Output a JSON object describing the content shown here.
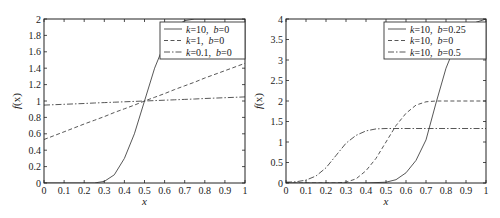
{
  "chart_data": [
    {
      "type": "line",
      "title": "",
      "xlabel": "x",
      "ylabel": "f(x)",
      "xlim": [
        0,
        1
      ],
      "ylim": [
        0,
        2
      ],
      "xticks": [
        "0",
        "0.1",
        "0.2",
        "0.3",
        "0.4",
        "0.5",
        "0.6",
        "0.7",
        "0.8",
        "0.9",
        "1"
      ],
      "yticks": [
        "0",
        "0.2",
        "0.4",
        "0.6",
        "0.8",
        "1",
        "1.2",
        "1.4",
        "1.6",
        "1.8",
        "2"
      ],
      "grid": false,
      "legend_position": "upper right",
      "x": [
        0,
        0.1,
        0.2,
        0.25,
        0.3,
        0.35,
        0.4,
        0.45,
        0.5,
        0.55,
        0.6,
        0.65,
        0.7,
        0.75,
        0.8,
        0.9,
        1.0
      ],
      "series": [
        {
          "name": "k=10, b=0",
          "k_label": "k",
          "k_value": "=10",
          "b_label": "b",
          "b_value": "=0",
          "style": "solid",
          "values": [
            0.0,
            0.0,
            0.0,
            0.0,
            0.02,
            0.1,
            0.3,
            0.6,
            1.0,
            1.4,
            1.7,
            1.9,
            1.98,
            2.0,
            2.0,
            2.0,
            2.0
          ]
        },
        {
          "name": "k=1, b=0",
          "k_label": "k",
          "k_value": "=1",
          "b_label": "b",
          "b_value": "=0",
          "style": "dashed",
          "values": [
            0.53,
            0.625,
            0.72,
            0.765,
            0.81,
            0.86,
            0.905,
            0.95,
            1.0,
            1.045,
            1.09,
            1.14,
            1.185,
            1.23,
            1.28,
            1.37,
            1.46
          ]
        },
        {
          "name": "k=0.1, b=0",
          "k_label": "k",
          "k_value": "=0.1",
          "b_label": "b",
          "b_value": "=0",
          "style": "dashdot",
          "values": [
            0.95,
            0.96,
            0.97,
            0.975,
            0.98,
            0.985,
            0.99,
            0.995,
            1.0,
            1.005,
            1.01,
            1.015,
            1.02,
            1.025,
            1.03,
            1.04,
            1.05
          ]
        }
      ]
    },
    {
      "type": "line",
      "title": "",
      "xlabel": "x",
      "ylabel": "f(x)",
      "xlim": [
        0,
        1
      ],
      "ylim": [
        0,
        4
      ],
      "xticks": [
        "0",
        "0.1",
        "0.2",
        "0.3",
        "0.4",
        "0.5",
        "0.6",
        "0.7",
        "0.8",
        "0.9",
        "1"
      ],
      "yticks": [
        "0",
        "0.5",
        "1",
        "1.5",
        "2",
        "2.5",
        "3",
        "3.5",
        "4"
      ],
      "grid": false,
      "legend_position": "upper right",
      "x": [
        0,
        0.05,
        0.1,
        0.15,
        0.2,
        0.25,
        0.3,
        0.35,
        0.4,
        0.45,
        0.5,
        0.55,
        0.6,
        0.65,
        0.7,
        0.75,
        0.8,
        0.85,
        0.9,
        0.95,
        1.0
      ],
      "series": [
        {
          "name": "k=10, b=0.25",
          "k_label": "k",
          "k_value": "=10",
          "b_label": "b",
          "b_value": "=0.25",
          "style": "solid",
          "values": [
            0.0,
            0.0,
            0.0,
            0.0,
            0.0,
            0.0,
            0.0,
            0.0,
            0.0,
            0.01,
            0.02,
            0.08,
            0.25,
            0.55,
            1.05,
            1.95,
            2.8,
            3.4,
            3.75,
            3.92,
            4.0
          ]
        },
        {
          "name": "k=10, b=0",
          "k_label": "k",
          "k_value": "=10",
          "b_label": "b",
          "b_value": "=0",
          "style": "dashed",
          "values": [
            0.0,
            0.0,
            0.0,
            0.0,
            0.0,
            0.0,
            0.02,
            0.1,
            0.3,
            0.6,
            1.0,
            1.4,
            1.7,
            1.9,
            1.98,
            2.0,
            2.0,
            2.0,
            2.0,
            2.0,
            2.0
          ]
        },
        {
          "name": "k=10, b=0.5",
          "k_label": "k",
          "k_value": "=10",
          "b_label": "b",
          "b_value": "=0.5",
          "style": "dashdot",
          "values": [
            0.02,
            0.03,
            0.07,
            0.17,
            0.37,
            0.67,
            0.97,
            1.16,
            1.27,
            1.32,
            1.33,
            1.33,
            1.33,
            1.33,
            1.33,
            1.33,
            1.33,
            1.33,
            1.33,
            1.33,
            1.33
          ]
        }
      ]
    }
  ],
  "colors": {
    "axis": "#222222",
    "line": "#444444",
    "legend_border": "#333333"
  },
  "plots": [
    {
      "ylabel_f": "f",
      "ylabel_x": "(x)",
      "xlabel": "x"
    },
    {
      "ylabel_f": "f",
      "ylabel_x": "(x)",
      "xlabel": "x"
    }
  ]
}
